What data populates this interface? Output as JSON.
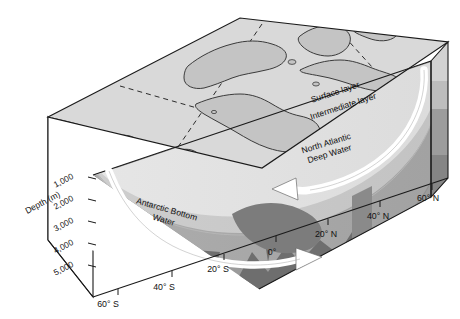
{
  "figure": {
    "kind": "oceanographic-block-diagram",
    "depth_axis": {
      "title": "Depth (m)",
      "ticks": [
        "1,000",
        "2,000",
        "3,000",
        "4,000",
        "5,000"
      ]
    },
    "latitude_axis": {
      "ticks": [
        "60° S",
        "40° S",
        "20° S",
        "0°",
        "20° N",
        "40° N",
        "60° N"
      ]
    },
    "water_masses": [
      {
        "id": "surface",
        "label": "Surface layer"
      },
      {
        "id": "intermediate",
        "label": "Intermediate layer"
      },
      {
        "id": "nadw",
        "label": "North Atlantic\nDeep Water",
        "line1": "North Atlantic",
        "line2": "Deep Water"
      },
      {
        "id": "aabw",
        "label": "Antarctic Bottom\nWater",
        "line1": "Antarctic Bottom",
        "line2": "Water"
      }
    ],
    "flow_arrows": [
      {
        "id": "nadw-southward",
        "direction": "left",
        "described": "North Atlantic Deep Water flowing south"
      },
      {
        "id": "nadw-sinking",
        "direction": "down",
        "described": "Deep water formation sinking at high northern latitude"
      },
      {
        "id": "aabw-northward",
        "direction": "right",
        "described": "Antarctic Bottom Water flowing north"
      }
    ],
    "colors": {
      "top_surface": "#d7d7d7",
      "land": "#c2c2c2",
      "surface_layer": "#e2e2e2",
      "intermediate_layer": "#c9c9c9",
      "deep_water": "#a8a8a8",
      "bottom_water": "#8f8f8f",
      "seafloor": "#6f6f6f",
      "side_panel": "#9a9a9a",
      "left_face": "#ffffff",
      "arrow_fill": "#ffffff",
      "outline": "#1a1a1a"
    }
  }
}
